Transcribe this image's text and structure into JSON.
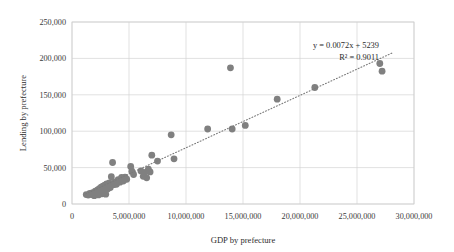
{
  "chart_data": {
    "type": "scatter",
    "title": "",
    "xlabel": "GDP by prefecture",
    "ylabel": "Lending by prefecture",
    "xlim": [
      0,
      30000000
    ],
    "ylim": [
      0,
      250000
    ],
    "grid": true,
    "legend": "none",
    "xticks": [
      0,
      5000000,
      10000000,
      15000000,
      20000000,
      25000000,
      30000000
    ],
    "xtick_labels": [
      "0",
      "5,000,000",
      "10,000,000",
      "15,000,000",
      "20,000,000",
      "25,000,000",
      "30,000,000"
    ],
    "yticks": [
      0,
      50000,
      100000,
      150000,
      200000,
      250000
    ],
    "ytick_labels": [
      "0",
      "50,000",
      "100,000",
      "150,000",
      "200,000",
      "250,000"
    ],
    "marker_color": "#808080",
    "trendline_color": "#7a7a7a",
    "annotations": {
      "equation": "y = 0.0072x + 5239",
      "r_squared": "R² = 0.9011"
    },
    "trendline": {
      "slope": 0.0072,
      "intercept": 5239,
      "x_start": 1200000,
      "x_end": 28200000
    },
    "series": [
      {
        "name": "Prefectures",
        "points": [
          [
            1250000,
            13000
          ],
          [
            1420000,
            12200
          ],
          [
            1560000,
            14500
          ],
          [
            1700000,
            13000
          ],
          [
            1820000,
            15500
          ],
          [
            1950000,
            11500
          ],
          [
            2050000,
            17500
          ],
          [
            2150000,
            13500
          ],
          [
            2250000,
            19500
          ],
          [
            2320000,
            12500
          ],
          [
            2400000,
            21000
          ],
          [
            2480000,
            16000
          ],
          [
            2560000,
            23000
          ],
          [
            2640000,
            14000
          ],
          [
            2720000,
            24500
          ],
          [
            2800000,
            18500
          ],
          [
            2880000,
            26000
          ],
          [
            2960000,
            13500
          ],
          [
            3040000,
            27500
          ],
          [
            3120000,
            20500
          ],
          [
            3200000,
            24000
          ],
          [
            3280000,
            29000
          ],
          [
            3360000,
            22500
          ],
          [
            3450000,
            37500
          ],
          [
            3560000,
            57000
          ],
          [
            3650000,
            26500
          ],
          [
            3780000,
            30500
          ],
          [
            3900000,
            27000
          ],
          [
            4050000,
            33500
          ],
          [
            4200000,
            30000
          ],
          [
            4350000,
            36500
          ],
          [
            4500000,
            31500
          ],
          [
            4650000,
            37000
          ],
          [
            4800000,
            34000
          ],
          [
            5150000,
            51500
          ],
          [
            5250000,
            45000
          ],
          [
            5400000,
            40500
          ],
          [
            6050000,
            45500
          ],
          [
            6250000,
            38000
          ],
          [
            6400000,
            43500
          ],
          [
            6550000,
            36000
          ],
          [
            6700000,
            48000
          ],
          [
            6850000,
            44000
          ],
          [
            7000000,
            67000
          ],
          [
            7500000,
            59000
          ],
          [
            8700000,
            95000
          ],
          [
            8950000,
            62000
          ],
          [
            11900000,
            103000
          ],
          [
            13900000,
            187000
          ],
          [
            14050000,
            103000
          ],
          [
            15200000,
            108000
          ],
          [
            18000000,
            144000
          ],
          [
            21300000,
            160000
          ],
          [
            27000000,
            193000
          ],
          [
            27200000,
            182500
          ]
        ]
      }
    ]
  }
}
